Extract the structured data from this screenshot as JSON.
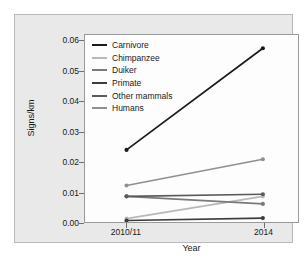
{
  "chart_data": {
    "type": "line",
    "title": "",
    "xlabel": "Year",
    "ylabel": "Signs/km",
    "categories": [
      "2010/11",
      "2014"
    ],
    "x": [
      0,
      1
    ],
    "ylim": [
      0.0,
      0.062
    ],
    "yticks": [
      0.0,
      0.01,
      0.02,
      0.03,
      0.04,
      0.05,
      0.06
    ],
    "ytick_labels": [
      "0.00",
      "0.01",
      "0.02",
      "0.03",
      "0.04",
      "0.05",
      "0.06"
    ],
    "xtick_labels": [
      "2010/11",
      "2014"
    ],
    "grid": false,
    "legend_position": "top-left",
    "markers": "filled-circle",
    "series": [
      {
        "name": "Carnivore",
        "values": [
          0.0239,
          0.0576
        ],
        "color": "#1a1a1a"
      },
      {
        "name": "Chimpanzee",
        "values": [
          0.0011,
          0.0085
        ],
        "color": "#b8b8b8"
      },
      {
        "name": "Duiker",
        "values": [
          0.0085,
          0.006
        ],
        "color": "#7a7a7a"
      },
      {
        "name": "Primate",
        "values": [
          0.0005,
          0.0013
        ],
        "color": "#3d3d3d"
      },
      {
        "name": "Other mammals",
        "values": [
          0.0085,
          0.0092
        ],
        "color": "#5a5a5a"
      },
      {
        "name": "Humans",
        "values": [
          0.0121,
          0.0208
        ],
        "color": "#909090"
      }
    ]
  },
  "legend": {
    "items": [
      {
        "label": "Carnivore"
      },
      {
        "label": "Chimpanzee"
      },
      {
        "label": "Duiker"
      },
      {
        "label": "Primate"
      },
      {
        "label": "Other mammals"
      },
      {
        "label": "Humans"
      }
    ]
  },
  "axes": {
    "y_title": "Signs/km",
    "x_title": "Year",
    "y_tick_labels": [
      "0.06",
      "0.05",
      "0.04",
      "0.03",
      "0.02",
      "0.01",
      "0.00"
    ],
    "x_tick_labels": [
      "2010/11",
      "2014"
    ]
  },
  "colors": {
    "figure_background": "#ffffff",
    "panel_background": "#e9e9e9",
    "plot_background": "#fdfdfd",
    "frame": "#9a9a9a",
    "text": "#1a1a1a"
  }
}
